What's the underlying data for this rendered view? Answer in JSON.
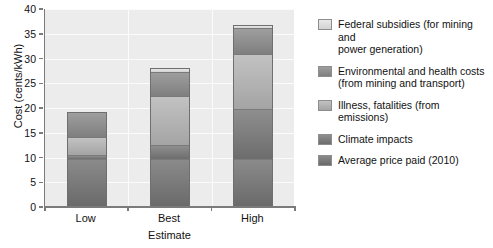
{
  "chart_data": {
    "type": "bar",
    "subtype": "stacked-bar",
    "title": "",
    "xlabel": "Estimate",
    "ylabel": "Cost (cents/kWh)",
    "categories": [
      "Low",
      "Best",
      "High"
    ],
    "ylim": [
      0,
      40
    ],
    "yticks": [
      0,
      5,
      10,
      15,
      20,
      25,
      30,
      35,
      40
    ],
    "ytick_labels": [
      "0",
      "5",
      "10",
      "15",
      "20",
      "25",
      "30",
      "35",
      "40"
    ],
    "grid": "horizontal-and-vertical",
    "legend_position": "right",
    "series": [
      {
        "name": "Average price paid (2010)",
        "color": "#7a7a7a",
        "values": [
          9.5,
          9.4,
          9.4
        ]
      },
      {
        "name": "Climate impacts",
        "color": "#7d7d7d",
        "values": [
          0.9,
          3.0,
          10.2
        ]
      },
      {
        "name": "Illness, fatalities (from emissions)",
        "color": "#b3b3b3",
        "values": [
          3.5,
          9.8,
          11.1
        ]
      },
      {
        "name": "Environmental and health costs (from mining and transport)",
        "color": "#8f8f8f",
        "values": [
          4.8,
          4.9,
          5.2
        ]
      },
      {
        "name": "Federal subsidies (for mining and power generation)",
        "color": "#dedede",
        "values": [
          0.0,
          0.6,
          0.4
        ]
      }
    ],
    "totals": [
      18.7,
      27.7,
      36.3
    ]
  },
  "legend": {
    "items": [
      {
        "label_line1": "Federal subsidies (for mining and",
        "label_line2": "power generation)",
        "swatch": "fill-0"
      },
      {
        "label_line1": "Environmental and health costs",
        "label_line2": "(from mining and transport)",
        "swatch": "fill-1"
      },
      {
        "label_line1": "Illness, fatalities (from",
        "label_line2": "emissions)",
        "swatch": "fill-2"
      },
      {
        "label_line1": "Climate impacts",
        "label_line2": "",
        "swatch": "fill-3"
      },
      {
        "label_line1": "Average price paid (2010)",
        "label_line2": "",
        "swatch": "fill-4"
      }
    ]
  },
  "axes": {
    "y_title": "Cost (cents/kWh)",
    "x_title": "Estimate",
    "y_labels": [
      "40",
      "35",
      "30",
      "25",
      "20",
      "15",
      "10",
      "5",
      "0"
    ],
    "x_labels": [
      "Low",
      "Best",
      "High"
    ]
  }
}
